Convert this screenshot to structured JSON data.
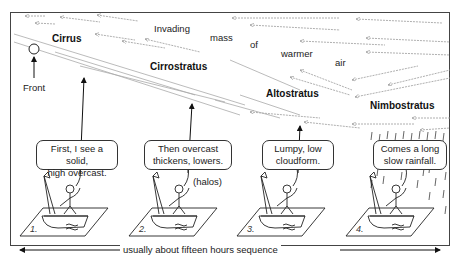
{
  "diagram": {
    "type": "warm-front-cloud-sequence",
    "air_mass_text": [
      "Invading",
      "mass",
      "of",
      "warmer",
      "air"
    ],
    "front_label": "Front",
    "clouds": [
      {
        "name": "Cirrus"
      },
      {
        "name": "Cirrostratus"
      },
      {
        "name": "Altostratus"
      },
      {
        "name": "Nimbostratus"
      }
    ],
    "panels": [
      {
        "number": "1.",
        "speech": [
          "First, I see a solid,",
          "high overcast."
        ]
      },
      {
        "number": "2.",
        "speech": [
          "Then overcast",
          "thickens, lowers."
        ],
        "note": "(halos)"
      },
      {
        "number": "3.",
        "speech": [
          "Lumpy, low",
          "cloudform."
        ]
      },
      {
        "number": "4.",
        "speech": [
          "Comes a long",
          "slow rainfall."
        ]
      }
    ],
    "timeline_label": "usually about fifteen hours sequence",
    "colors": {
      "line": "#333333",
      "streak": "#999999",
      "frame": "#444444"
    }
  }
}
